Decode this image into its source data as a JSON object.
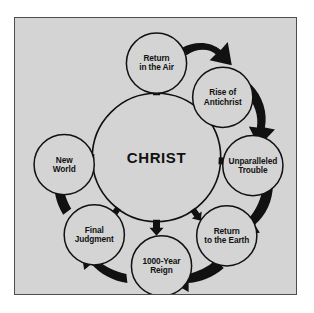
{
  "page": {
    "top_text_fragment": "",
    "background_color": "#ffffff"
  },
  "figure": {
    "frame_fill": "#d4d4d4",
    "frame_border_color": "#4e4e4e",
    "circle_fill": "#d4d4d4",
    "circle_stroke": "#111111",
    "arrow_color": "#111111",
    "text_color": "#111111"
  },
  "diagram": {
    "type": "cycle",
    "center": {
      "id": "christ",
      "label": "CHRIST",
      "cx": 141,
      "cy": 139,
      "r": 64
    },
    "nodes": [
      {
        "id": "return-in-the-air",
        "label": "Return\nin the Air",
        "cx": 141,
        "cy": 45,
        "r": 30,
        "angle": 270
      },
      {
        "id": "rise-of-antichrist",
        "label": "Rise of\nAntichrist",
        "cx": 207,
        "cy": 79,
        "r": 30,
        "angle": 333
      },
      {
        "id": "unparalleled-trouble",
        "label": "Unparalleled\nTrouble",
        "cx": 237,
        "cy": 147,
        "r": 30,
        "angle": 7
      },
      {
        "id": "return-to-the-earth",
        "label": "Return\nto the Earth",
        "cx": 211,
        "cy": 217,
        "r": 30,
        "angle": 52
      },
      {
        "id": "1000-year-reign",
        "label": "1000-Year\nReign",
        "cx": 146,
        "cy": 247,
        "r": 30,
        "angle": 90
      },
      {
        "id": "final-judgment",
        "label": "Final\nJudgment",
        "cx": 79,
        "cy": 216,
        "r": 30,
        "angle": 128
      },
      {
        "id": "new-world",
        "label": "New\nWorld",
        "cx": 49,
        "cy": 146,
        "r": 30,
        "angle": 183
      }
    ],
    "inner_arrows": [
      {
        "id": "arrow-to-return-in-the-air",
        "angle": 270,
        "target": "return-in-the-air"
      },
      {
        "id": "arrow-to-rise-of-antichrist",
        "angle": 325,
        "target": "rise-of-antichrist"
      },
      {
        "id": "arrow-to-unparalleled-trouble",
        "angle": 3,
        "target": "unparalleled-trouble"
      },
      {
        "id": "arrow-to-return-to-the-earth",
        "angle": 55,
        "target": "return-to-the-earth"
      },
      {
        "id": "arrow-to-1000-year-reign",
        "angle": 90,
        "target": "1000-year-reign"
      },
      {
        "id": "arrow-to-final-judgment",
        "angle": 127,
        "target": "final-judgment"
      },
      {
        "id": "arrow-to-new-world",
        "angle": 180,
        "target": "new-world"
      }
    ],
    "outer_arrows": [
      {
        "id": "flow-air-to-antichrist",
        "from": "return-in-the-air",
        "to": "rise-of-antichrist"
      },
      {
        "id": "flow-antichrist-to-trouble",
        "from": "rise-of-antichrist",
        "to": "unparalleled-trouble"
      },
      {
        "id": "flow-trouble-to-earth",
        "from": "unparalleled-trouble",
        "to": "return-to-the-earth"
      },
      {
        "id": "flow-earth-to-reign",
        "from": "return-to-the-earth",
        "to": "1000-year-reign"
      },
      {
        "id": "flow-reign-to-judgment",
        "from": "1000-year-reign",
        "to": "final-judgment"
      },
      {
        "id": "flow-judgment-to-new-world",
        "from": "final-judgment",
        "to": "new-world"
      }
    ]
  }
}
